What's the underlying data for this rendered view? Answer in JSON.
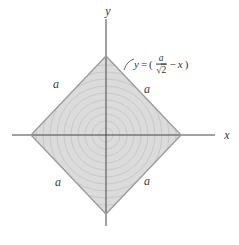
{
  "colors": {
    "background": "#ffffff",
    "region_fill": "#dbdbdb",
    "circle_stroke": "#c3c3c3",
    "outline": "#9a9a9a",
    "axis": "#454545",
    "leader": "#555555",
    "text": "#3a3a3a"
  },
  "labels": {
    "x_axis": "x",
    "y_axis": "y",
    "side_upper_left": "a",
    "side_upper_right": "a",
    "side_lower_left": "a",
    "side_lower_right": "a"
  },
  "equation": {
    "lhs": "y",
    "equals": "=",
    "open_paren": "(",
    "numerator": "a",
    "radical": "√",
    "radicand": "2",
    "minus": "−",
    "variable": "x",
    "close_paren": ")"
  },
  "figure": {
    "type": "geometry-diagram",
    "width": 239,
    "height": 245,
    "center": {
      "x": 106,
      "y": 135
    },
    "vertices": [
      [
        106,
        56
      ],
      [
        181,
        135
      ],
      [
        106,
        214
      ],
      [
        31,
        135
      ]
    ],
    "x_axis": {
      "x1": 12,
      "y1": 135,
      "x2": 215,
      "y2": 135
    },
    "y_axis": {
      "x1": 106,
      "y1": 19,
      "x2": 106,
      "y2": 226
    },
    "circles": {
      "count": 10,
      "spacing": 7
    },
    "leader_path": "M124,70 Q127,61 134,59"
  }
}
